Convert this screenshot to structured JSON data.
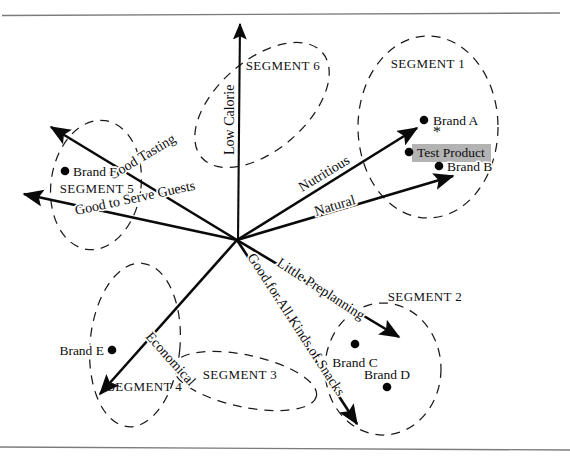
{
  "figure": {
    "type": "perceptual-map",
    "title": "",
    "background_color": "#ffffff",
    "ink_color": "#0a0a0a",
    "highlight_color": "#b3b3b3"
  },
  "origin": {
    "x": 237,
    "y": 240
  },
  "frame": {
    "top_line_label": "top-border-rule",
    "bottom_line_label": "bottom-border-rule"
  },
  "attribute_vectors": [
    {
      "id": "low-calorie",
      "label": "Low Calorie",
      "x1": 238,
      "y1": 240,
      "x2": 240,
      "y2": 24,
      "label_x": 234,
      "label_y": 155,
      "rotate": -90
    },
    {
      "id": "good-tasting",
      "label": "Good Tasting",
      "x1": 237,
      "y1": 240,
      "x2": 51,
      "y2": 127,
      "label_x": 112,
      "label_y": 180,
      "rotate": -31
    },
    {
      "id": "good-to-serve-guests",
      "label": "Good to Serve Guests",
      "x1": 237,
      "y1": 240,
      "x2": 24,
      "y2": 194,
      "label_x": 76,
      "label_y": 215,
      "rotate": -12
    },
    {
      "id": "nutritious",
      "label": "Nutritious",
      "x1": 237,
      "y1": 240,
      "x2": 417,
      "y2": 128,
      "label_x": 302,
      "label_y": 192,
      "rotate": -31
    },
    {
      "id": "natural",
      "label": "Natural",
      "x1": 237,
      "y1": 240,
      "x2": 453,
      "y2": 176,
      "label_x": 316,
      "label_y": 216,
      "rotate": -17
    },
    {
      "id": "little-preplanning",
      "label": "Little Preplanning",
      "x1": 237,
      "y1": 240,
      "x2": 399,
      "y2": 337,
      "label_x": 276,
      "label_y": 265,
      "rotate": 33
    },
    {
      "id": "good-for-all-kinds-of-snacks",
      "label": "Good for All Kinds of Snacks",
      "x1": 237,
      "y1": 240,
      "x2": 357,
      "y2": 424,
      "label_x": 247,
      "label_y": 257,
      "rotate": 57
    },
    {
      "id": "economical",
      "label": "Economical",
      "x1": 237,
      "y1": 240,
      "x2": 100,
      "y2": 394,
      "label_x": 145,
      "label_y": 337,
      "rotate": 48
    }
  ],
  "segments": [
    {
      "id": "segment-1",
      "label": "SEGMENT 1",
      "cx": 428,
      "cy": 127,
      "rx": 70,
      "ry": 91,
      "rot": 0,
      "label_x": 428,
      "label_y": 68
    },
    {
      "id": "segment-2",
      "label": "SEGMENT 2",
      "cx": 383,
      "cy": 369,
      "rx": 58,
      "ry": 66,
      "rot": 0,
      "label_x": 425,
      "label_y": 301
    },
    {
      "id": "segment-3",
      "label": "SEGMENT 3",
      "cx": 245,
      "cy": 381,
      "rx": 73,
      "ry": 26,
      "rot": 12,
      "label_x": 240,
      "label_y": 379
    },
    {
      "id": "segment-4",
      "label": "SEGMENT 4",
      "cx": 135,
      "cy": 345,
      "rx": 45,
      "ry": 82,
      "rot": 5,
      "label_x": 145,
      "label_y": 391
    },
    {
      "id": "segment-5",
      "label": "SEGMENT 5",
      "cx": 96,
      "cy": 185,
      "rx": 45,
      "ry": 65,
      "rot": 8,
      "label_x": 97,
      "label_y": 193
    },
    {
      "id": "segment-6",
      "label": "SEGMENT 6",
      "cx": 262,
      "cy": 105,
      "rx": 80,
      "ry": 45,
      "rot": -41,
      "label_x": 283,
      "label_y": 70
    }
  ],
  "brands": [
    {
      "id": "brand-a",
      "label": "Brand A",
      "dot_x": 424,
      "dot_y": 120,
      "label_x": 433,
      "label_y": 125,
      "anchor": "start"
    },
    {
      "id": "brand-b",
      "label": "Brand B",
      "dot_x": 439,
      "dot_y": 166,
      "label_x": 447,
      "label_y": 171,
      "anchor": "start"
    },
    {
      "id": "brand-c",
      "label": "Brand C",
      "dot_x": 355,
      "dot_y": 344,
      "label_x": 355,
      "label_y": 367,
      "anchor": "middle"
    },
    {
      "id": "brand-d",
      "label": "Brand D",
      "dot_x": 387,
      "dot_y": 387,
      "label_x": 387,
      "label_y": 379,
      "anchor": "middle"
    },
    {
      "id": "brand-e",
      "label": "Brand E",
      "dot_x": 112,
      "dot_y": 350,
      "label_x": 104,
      "label_y": 355,
      "anchor": "end"
    },
    {
      "id": "brand-f",
      "label": "Brand F",
      "dot_x": 65,
      "dot_y": 171,
      "label_x": 73,
      "label_y": 176,
      "anchor": "start"
    }
  ],
  "test_product": {
    "id": "test-product",
    "label": "Test Product",
    "dot_x": 409,
    "dot_y": 152,
    "label_x": 417,
    "label_y": 157,
    "highlight_x": 412,
    "highlight_y": 144,
    "highlight_w": 79,
    "highlight_h": 18,
    "asterisk": "*",
    "asterisk_x": 437,
    "asterisk_y": 137
  },
  "chart_data": {
    "type": "scatter",
    "title": "",
    "xlabel": "",
    "ylabel": "",
    "vectors": [
      "Low Calorie",
      "Good Tasting",
      "Good to Serve Guests",
      "Nutritious",
      "Natural",
      "Little Preplanning",
      "Good for All Kinds of Snacks",
      "Economical"
    ],
    "segments": [
      "SEGMENT 1",
      "SEGMENT 2",
      "SEGMENT 3",
      "SEGMENT 4",
      "SEGMENT 5",
      "SEGMENT 6"
    ],
    "points": [
      {
        "name": "Brand A",
        "x": 424,
        "y": 120,
        "segment": "SEGMENT 1"
      },
      {
        "name": "Test Product",
        "x": 409,
        "y": 152,
        "segment": "SEGMENT 1"
      },
      {
        "name": "Brand B",
        "x": 439,
        "y": 166,
        "segment": "SEGMENT 1"
      },
      {
        "name": "Brand C",
        "x": 355,
        "y": 344,
        "segment": "SEGMENT 2"
      },
      {
        "name": "Brand D",
        "x": 387,
        "y": 387,
        "segment": "SEGMENT 2"
      },
      {
        "name": "Brand E",
        "x": 112,
        "y": 350,
        "segment": "SEGMENT 4"
      },
      {
        "name": "Brand F",
        "x": 65,
        "y": 171,
        "segment": "SEGMENT 5"
      }
    ],
    "origin": {
      "x": 237,
      "y": 240
    },
    "grid": false,
    "legend": "none"
  }
}
